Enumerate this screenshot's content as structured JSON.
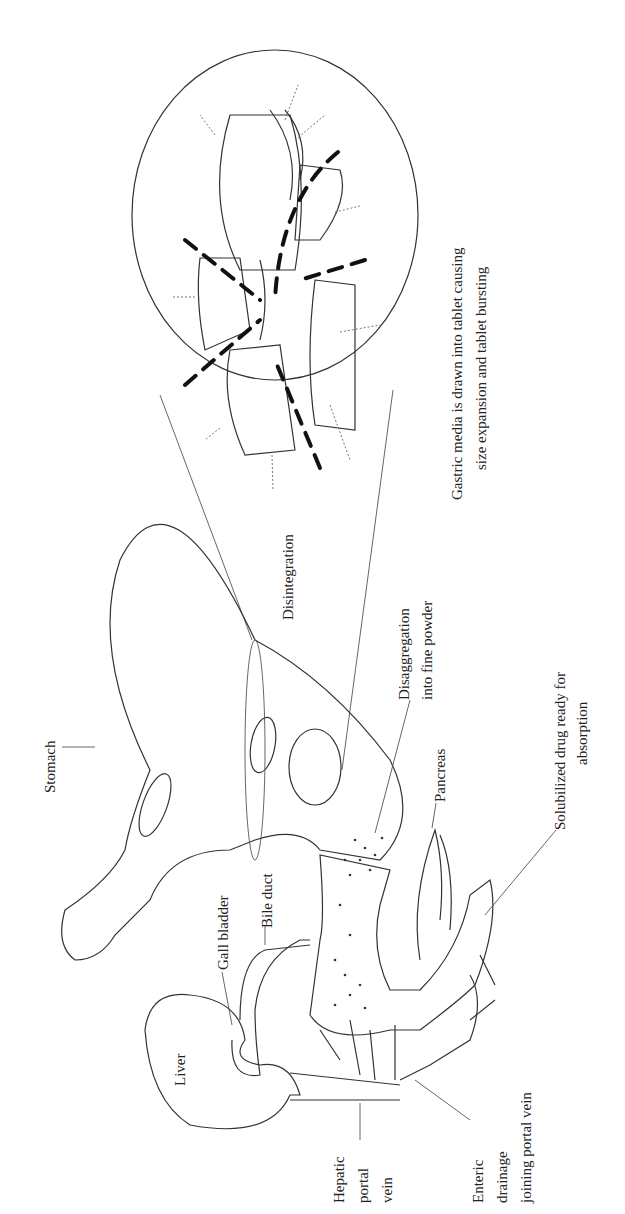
{
  "figure": {
    "orientation": "rotated 90 degrees counter-clockwise",
    "labels": {
      "gastric_media_line1": "Gastric media is drawn into tablet causing",
      "gastric_media_line2": "size expansion and tablet bursting",
      "disintegration": "Disintegration",
      "disaggregation_line1": "Disaggregation",
      "disaggregation_line2": "into fine powder",
      "stomach": "Stomach",
      "pancreas": "Pancreas",
      "solubilized_line1": "Solubilized drug ready for",
      "solubilized_line2": "absorption",
      "gall_bladder": "Gall bladder",
      "bile_duct": "Bile duct",
      "liver": "Liver",
      "hepatic_line1": "Hepatic",
      "hepatic_line2": "portal",
      "hepatic_line3": "vein",
      "enteric_line1": "Enteric",
      "enteric_line2": "drainage",
      "enteric_line3": "joining portal vein"
    }
  }
}
